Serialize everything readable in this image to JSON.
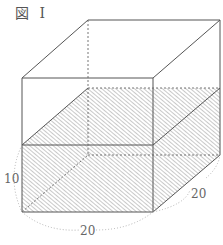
{
  "figure": {
    "title": "図 I",
    "labels": {
      "height": "10",
      "width_front": "20",
      "depth_side": "20"
    },
    "colors": {
      "edge": "#555555",
      "hatch": "#888888",
      "dimension_arc": "#aaaaaa"
    }
  }
}
